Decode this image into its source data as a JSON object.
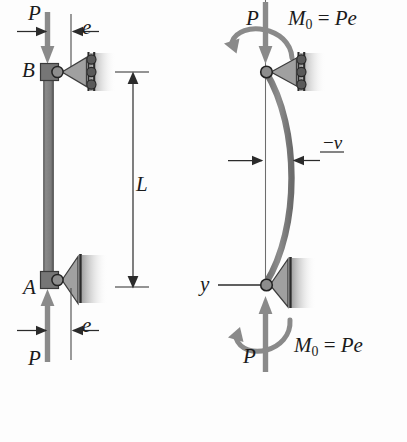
{
  "figure": {
    "type": "engineering-mechanics-diagram",
    "background_color": "#fdfdfd",
    "ink_color": "#1b1b1b",
    "member_color": "#808080",
    "support_color": "#9a9a9a",
    "panels": [
      {
        "id": "left",
        "name": "undeformed-column-with-eccentric-load",
        "labels": {
          "top_force": "P",
          "bottom_force": "P",
          "top_joint": "B",
          "bottom_joint": "A",
          "top_eccentricity": "e",
          "bottom_eccentricity": "e",
          "length": "L"
        }
      },
      {
        "id": "right",
        "name": "deformed-column-with-equivalent-end-moments",
        "labels": {
          "top_force": "P",
          "bottom_force": "P",
          "top_moment_symbol": "M",
          "top_moment_subscript": "0",
          "top_moment_equals": "=",
          "top_moment_value": "Pe",
          "bottom_moment_symbol": "M",
          "bottom_moment_subscript": "0",
          "bottom_moment_equals": "=",
          "bottom_moment_value": "Pe",
          "deflection": "v",
          "deflection_sign": "−",
          "axis": "y"
        }
      }
    ]
  }
}
